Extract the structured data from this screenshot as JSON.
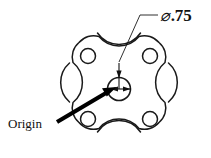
{
  "drawing": {
    "title": "Mechanical plate part detail drawing",
    "background_color": "#ffffff",
    "line_color": "#1a1a1a",
    "annotations": {
      "diameter": {
        "symbol": "⌀",
        "value": ".75",
        "full_text": "⌀.75",
        "name": "center-hole-diameter-callout"
      },
      "origin": {
        "label": "Origin",
        "name": "origin-callout"
      }
    },
    "geometry": {
      "part_outline": {
        "name": "four-lobed-plate-outline",
        "description": "square plate with four rounded corner lobes and four concave side arcs",
        "center_x": 119,
        "center_y": 89,
        "corner_lobe_radius": 19,
        "side_arc_radius": 26
      },
      "corner_holes": [
        {
          "name": "hole-top-left",
          "cx": 88,
          "cy": 56,
          "r": 7.5
        },
        {
          "name": "hole-top-right",
          "cx": 150,
          "cy": 56,
          "r": 7.5
        },
        {
          "name": "hole-bottom-left",
          "cx": 88,
          "cy": 119,
          "r": 7.5
        },
        {
          "name": "hole-bottom-right",
          "cx": 150,
          "cy": 119,
          "r": 7.5
        }
      ],
      "center_hole": {
        "name": "center-hole",
        "cx": 119,
        "cy": 89,
        "r": 11.5,
        "diameter_label": ".75"
      }
    }
  }
}
